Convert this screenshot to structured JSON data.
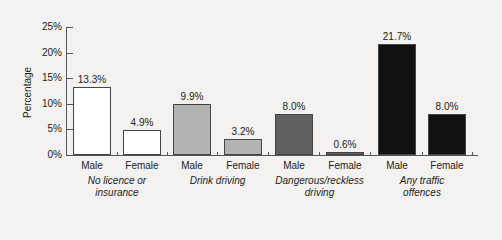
{
  "chart_data": {
    "type": "bar",
    "title": "",
    "xlabel": "",
    "ylabel": "Percentage",
    "ylim": [
      0,
      25
    ],
    "yticks": [
      "0%",
      "5%",
      "10%",
      "15%",
      "20%",
      "25%"
    ],
    "grid": false,
    "categories": [
      "No licence or insurance",
      "Drink driving",
      "Dangerous/reckless driving",
      "Any traffic offences"
    ],
    "series": [
      {
        "name": "Male",
        "values": [
          13.3,
          9.9,
          8.0,
          21.7
        ]
      },
      {
        "name": "Female",
        "values": [
          4.9,
          3.2,
          0.6,
          8.0
        ]
      }
    ],
    "bars": [
      {
        "group": "No licence or insurance",
        "sex": "Male",
        "value": 13.3,
        "label": "13.3%",
        "color": "#ffffff"
      },
      {
        "group": "No licence or insurance",
        "sex": "Female",
        "value": 4.9,
        "label": "4.9%",
        "color": "#ffffff"
      },
      {
        "group": "Drink driving",
        "sex": "Male",
        "value": 9.9,
        "label": "9.9%",
        "color": "#b3b3b3"
      },
      {
        "group": "Drink driving",
        "sex": "Female",
        "value": 3.2,
        "label": "3.2%",
        "color": "#b3b3b3"
      },
      {
        "group": "Dangerous/reckless driving",
        "sex": "Male",
        "value": 8.0,
        "label": "8.0%",
        "color": "#606060"
      },
      {
        "group": "Dangerous/reckless driving",
        "sex": "Female",
        "value": 0.6,
        "label": "0.6%",
        "color": "#606060"
      },
      {
        "group": "Any traffic offences",
        "sex": "Male",
        "value": 21.7,
        "label": "21.7%",
        "color": "#111111"
      },
      {
        "group": "Any traffic offences",
        "sex": "Female",
        "value": 8.0,
        "label": "8.0%",
        "color": "#111111"
      }
    ],
    "group_labels": [
      {
        "line1": "No licence or",
        "line2": "insurance"
      },
      {
        "line1": "Drink driving",
        "line2": ""
      },
      {
        "line1": "Dangerous/reckless",
        "line2": "driving"
      },
      {
        "line1": "Any traffic",
        "line2": "offences"
      }
    ],
    "legend": null
  }
}
